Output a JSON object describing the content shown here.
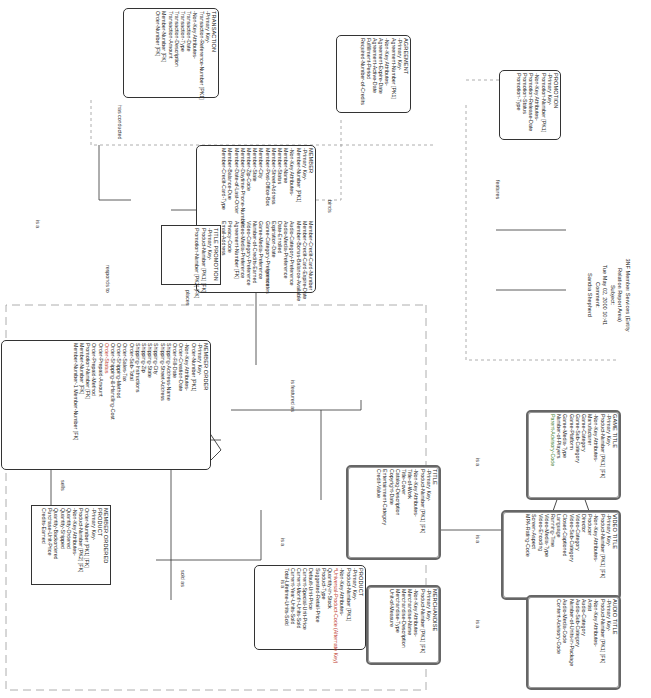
{
  "diagram": {
    "title_block": {
      "lines": [
        "3NF Member Services (Entity",
        "Relation Report Area)",
        "Subject:",
        "Tue May 02, 2000 10:41",
        "Comment:",
        "Sandra Shepherd"
      ]
    },
    "entities": {
      "transaction": {
        "name": "TRANSACTION",
        "rows": [
          "-Primary Key-",
          "Transaction-Reference-Number [PK1]",
          "-Non-Key Attributes-",
          "Transaction-Date",
          "Transaction-Type",
          "Transaction-Description",
          "Transaction-Amount",
          "Member-Number [FK]",
          "Order-Number [FK]"
        ]
      },
      "agreement": {
        "name": "AGREEMENT",
        "rows": [
          "-Primary Key-",
          "Agreement-Number [PK1]",
          "-Non-Key Attributes-",
          "Agreement-Expire-Date",
          "Agreement-Active-Date",
          "Fulfillment-Period",
          "Required-Number-of-Credits"
        ]
      },
      "promotion": {
        "name": "PROMOTION",
        "rows": [
          "-Primary Key-",
          "Promotion-Number [PK1]",
          "-Non-Key Attributes-",
          "Promotion-Release-Date",
          "Promotion-Status",
          "Promotion-Type"
        ]
      },
      "member": {
        "name": "MEMBER",
        "rows": [
          "-Primary Key-",
          "Member-Number [PK1]",
          "-Non-Key Attributes-",
          "Member-Name",
          "Member-Status",
          "Member-Street-Address",
          "Member-Post-Office-Box",
          "Member-City",
          "Member-State",
          "Member-Zip-Code",
          "Member-Daytime-Phone-Number",
          "Member-Date-of-Last-Order",
          "Member-Balance-Due",
          "Member-Credit-Card-Type",
          "Member-Credit-Card-Number",
          "Member-Credit-Card-Expire-Date",
          "Member-Bonus-Balance-Available",
          "Audio-Category-Preference",
          "Audio-Media-Preference",
          "Date-Enrolled",
          "Expiration-Date",
          "Game-Category-Preference",
          "Game-Media-Preference",
          "Number-of-Credits-Earned",
          "Video-Category-Preference",
          "Video-Media-Preference",
          "Agreement-Number [FK]",
          "Privacy-Code",
          "Email-Address"
        ]
      },
      "member_order": {
        "name": "MEMBER ORDER",
        "rows": [
          "-Primary Key-",
          "Order-Number [PK1]",
          "-Non-Key Attributes-",
          "Order-Creation-Date",
          "Order-Fill-Date",
          "Shipping-Address-Name",
          "Shipping-Street-Address",
          "Shipping-City",
          "Shipping-State",
          "Shipping-Zip",
          "Shipping-Instructions",
          "Order-Sub-Total",
          "Order-Sales-Tax",
          "Order-Shipping-Method",
          "Order-Shipping-&-Handling-Cost",
          "Order-Status",
          "Order-Prepaid-Amount",
          "Order-Prepaid-Method",
          "Promotion-Number [FK]",
          "Member-Number [FK]",
          "Member-Number-1 Member-Number [FK]"
        ]
      },
      "title_promotion": {
        "name": "TITLE PROMOTION",
        "rows": [
          "-Primary Key-",
          "Product-Number [PK1] [FK]",
          "Promotion-Number [PK2] [FK]"
        ]
      },
      "member_ordered_product": {
        "name": "MEMBER ORDERED PRODUCT",
        "rows": [
          "-Primary Key-",
          "Order-Number [PK1] [FK]",
          "Product-Number [PK2] [FK]",
          "-Non-Key Attributes-",
          "Quantity-Ordered",
          "Quantity-Shipped",
          "Quantity-Backordered",
          "Purchase-Unit-Price",
          "Credits-Earned"
        ]
      },
      "product": {
        "name": "PRODUCT",
        "rows": [
          "-Primary Key-",
          "Product-Number [PK1]",
          "-Non-Key Attributes-",
          "*Universal-Product-Code (Alternate Key)",
          "Quantity-in-Stock",
          "Product-Type",
          "Suggested-Retail-Price",
          "Default-Unit-Price",
          "Current-Special-Unit-Price",
          "Current-Month-Units-Sold",
          "Current-Year-Units-Sold",
          "Total-Lifetime-Units-Sold"
        ]
      },
      "title": {
        "name": "TITLE",
        "rows": [
          "-Primary Key-",
          "Product-Number [PK1] [FK]",
          "-Non-Key Attributes-",
          "Title-of-Work",
          "Title-Cover",
          "Catalog-Description",
          "Copyright-Date",
          "Entertainment-Category",
          "Credit-Value"
        ]
      },
      "merchandise": {
        "name": "MERCHANDISE",
        "rows": [
          "-Primary Key-",
          "Product-Number [PK1] [FK]",
          "-Non-Key Attributes-",
          "Merchandise-Name",
          "Merchandise-Description",
          "Merchandise-Type",
          "Unit-of-Measure"
        ]
      },
      "game_title": {
        "name": "GAME TITLE",
        "rows": [
          "-Primary Key-",
          "Product-Number [PK1] [FK]",
          "-Non-Key Attributes-",
          "Manufacturer",
          "Game-Category",
          "Game-Sub-Category",
          "Game-Platform",
          "Game-Media-Type",
          "Number-of-Players",
          "Parent-Advisory-Code"
        ]
      },
      "video_title": {
        "name": "VIDEO TITLE",
        "rows": [
          "-Primary Key-",
          "Product-Number [PK1] [FK]",
          "-Non-Key Attributes-",
          "Producer",
          "Director",
          "Video-Category",
          "Video-Sub-Category",
          "Closed-Captioned",
          "Language",
          "Running-Time",
          "Video-Media-Type",
          "Video-Encoding",
          "Screen-Aspect",
          "MPA-Rating-Code"
        ]
      },
      "audio_title": {
        "name": "AUDIO TITLE",
        "rows": [
          "-Primary Key-",
          "Product-Number [PK1] [FK]",
          "-Non-Key Attributes-",
          "Artist",
          "Audio-Category",
          "Audio-Sub-Category",
          "Number-of-Units-in-Package",
          "Audio-Media-Code",
          "Content-Advisory-Code"
        ]
      }
    },
    "relationships": {
      "is_a_top": "is a",
      "has_conducted": "has conducted",
      "binds": "binds",
      "responds_to": "responds to",
      "places": "places",
      "generates": "generates",
      "features": "features",
      "sells": "sells",
      "sold_as": "sold as",
      "is_featured_as": "is featured as",
      "is_a_title": "is a",
      "is_a_merch": "is a",
      "is_a_game": "is a",
      "is_a_video": "is a",
      "is_a_audio": "is a"
    }
  }
}
